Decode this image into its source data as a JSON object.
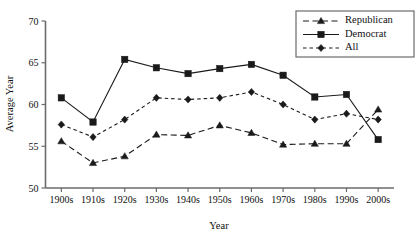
{
  "chart_data": {
    "type": "line",
    "title": "",
    "xlabel": "Year",
    "ylabel": "Average Year",
    "ylim": [
      50,
      70
    ],
    "yticks": [
      50,
      55,
      60,
      65,
      70
    ],
    "grid": false,
    "legend_position": "top-right",
    "categories": [
      "1900s",
      "1910s",
      "1920s",
      "1930s",
      "1940s",
      "1950s",
      "1960s",
      "1970s",
      "1980s",
      "1990s",
      "2000s"
    ],
    "series": [
      {
        "name": "Republican",
        "marker": "triangle",
        "linestyle": "long-dash",
        "color": "#1a1a1a",
        "values": [
          55.6,
          53.0,
          53.8,
          56.4,
          56.3,
          57.5,
          56.6,
          55.2,
          55.3,
          55.3,
          59.4
        ]
      },
      {
        "name": "Democrat",
        "marker": "square",
        "linestyle": "solid",
        "color": "#1a1a1a",
        "values": [
          60.8,
          57.9,
          65.4,
          64.4,
          63.7,
          64.3,
          64.8,
          63.5,
          60.9,
          61.2,
          55.8
        ]
      },
      {
        "name": "All",
        "marker": "diamond",
        "linestyle": "short-dash",
        "color": "#1a1a1a",
        "values": [
          57.6,
          56.1,
          58.2,
          60.8,
          60.6,
          60.8,
          61.5,
          60.0,
          58.2,
          58.9,
          58.2
        ]
      }
    ]
  },
  "legend": {
    "items": [
      {
        "label": "Republican"
      },
      {
        "label": "Democrat"
      },
      {
        "label": "All"
      }
    ]
  },
  "axes": {
    "y_title": "Average Year",
    "x_title": "Year"
  }
}
